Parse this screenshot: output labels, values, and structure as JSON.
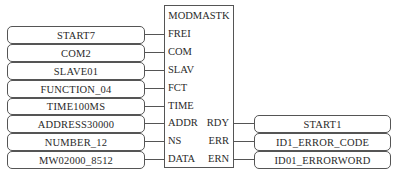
{
  "caption": "",
  "block": {
    "title": "MODMASTK",
    "inputs": [
      "FREI",
      "COM",
      "SLAV",
      "FCT",
      "TIME",
      "ADDR",
      "NS",
      "DATA"
    ],
    "outputs": [
      "RDY",
      "ERR",
      "ERN"
    ]
  },
  "input_values": [
    "START7",
    "COM2",
    "SLAVE01",
    "FUNCTION_04",
    "TIME100MS",
    "ADDRESS30000",
    "NUMBER_12",
    "MW02000_8512"
  ],
  "output_values": [
    "START1",
    "ID1_ERROR_CODE",
    "ID01_ERRORWORD"
  ]
}
